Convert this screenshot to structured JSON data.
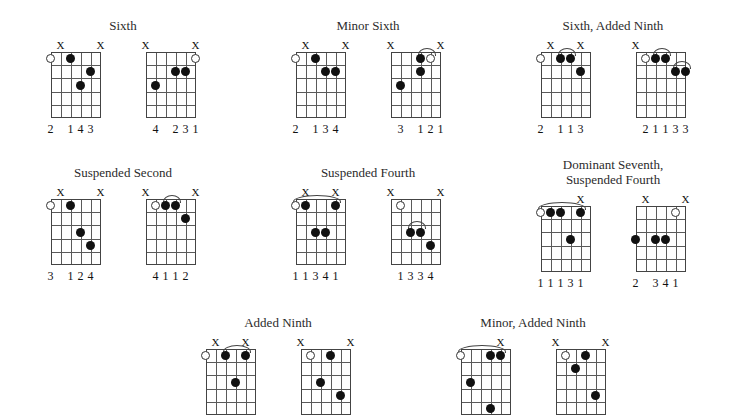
{
  "page": {
    "background": "#ffffff",
    "line_color": "#5a5a5a",
    "dot_color": "#111111",
    "text_color": "#1a1a1a",
    "strings": 6,
    "frets": 5
  },
  "groups": [
    {
      "title": "Sixth",
      "left": 8,
      "top": 18,
      "width": 230,
      "diagrams": [
        {
          "name": "sixth-voicing-1",
          "muted": [
            1,
            5
          ],
          "open": [
            0
          ],
          "dots": [
            {
              "string": 2,
              "fret": 1
            },
            {
              "string": 4,
              "fret": 2
            },
            {
              "string": 3,
              "fret": 3
            }
          ],
          "barres": [],
          "fingers": [
            {
              "string": 0,
              "label": "2"
            },
            {
              "string": 2,
              "label": "1"
            },
            {
              "string": 3,
              "label": "4"
            },
            {
              "string": 4,
              "label": "3"
            }
          ]
        },
        {
          "name": "sixth-voicing-2",
          "muted": [
            0,
            5
          ],
          "open": [
            5
          ],
          "dots": [
            {
              "string": 3,
              "fret": 2
            },
            {
              "string": 4,
              "fret": 2
            },
            {
              "string": 1,
              "fret": 3
            }
          ],
          "barres": [],
          "fingers": [
            {
              "string": 1,
              "label": "4"
            },
            {
              "string": 3,
              "label": "2"
            },
            {
              "string": 4,
              "label": "3"
            },
            {
              "string": 5,
              "label": "1"
            }
          ]
        }
      ]
    },
    {
      "title": "Minor Sixth",
      "left": 253,
      "top": 18,
      "width": 230,
      "diagrams": [
        {
          "name": "minor-sixth-voicing-1",
          "muted": [
            1,
            5
          ],
          "open": [
            0
          ],
          "dots": [
            {
              "string": 2,
              "fret": 1
            },
            {
              "string": 3,
              "fret": 2
            },
            {
              "string": 4,
              "fret": 2
            }
          ],
          "barres": [],
          "fingers": [
            {
              "string": 0,
              "label": "2"
            },
            {
              "string": 2,
              "label": "1"
            },
            {
              "string": 3,
              "label": "3"
            },
            {
              "string": 4,
              "label": "4"
            }
          ]
        },
        {
          "name": "minor-sixth-voicing-2",
          "muted": [
            0,
            5
          ],
          "open": [
            4
          ],
          "dots": [
            {
              "string": 3,
              "fret": 1
            },
            {
              "string": 3,
              "fret": 2
            },
            {
              "string": 1,
              "fret": 3
            }
          ],
          "barres": [
            {
              "from": 3,
              "to": 4,
              "fret": 1
            }
          ],
          "fingers": [
            {
              "string": 1,
              "label": "3"
            },
            {
              "string": 3,
              "label": "1"
            },
            {
              "string": 4,
              "label": "2"
            },
            {
              "string": 5,
              "label": "1"
            }
          ]
        }
      ]
    },
    {
      "title": "Sixth, Added Ninth",
      "left": 498,
      "top": 18,
      "width": 230,
      "diagrams": [
        {
          "name": "sixth-added-ninth-voicing-1",
          "muted": [
            1,
            4
          ],
          "open": [
            0
          ],
          "dots": [
            {
              "string": 2,
              "fret": 1
            },
            {
              "string": 3,
              "fret": 1
            },
            {
              "string": 4,
              "fret": 2
            }
          ],
          "barres": [
            {
              "from": 2,
              "to": 3,
              "fret": 1
            }
          ],
          "fingers": [
            {
              "string": 0,
              "label": "2"
            },
            {
              "string": 2,
              "label": "1"
            },
            {
              "string": 3,
              "label": "1"
            },
            {
              "string": 4,
              "label": "3"
            }
          ]
        },
        {
          "name": "sixth-added-ninth-voicing-2",
          "muted": [
            0
          ],
          "open": [
            1
          ],
          "dots": [
            {
              "string": 2,
              "fret": 1
            },
            {
              "string": 3,
              "fret": 1
            },
            {
              "string": 4,
              "fret": 2
            },
            {
              "string": 5,
              "fret": 2
            }
          ],
          "barres": [
            {
              "from": 2,
              "to": 3,
              "fret": 1
            },
            {
              "from": 4,
              "to": 5,
              "fret": 2
            }
          ],
          "fingers": [
            {
              "string": 1,
              "label": "2"
            },
            {
              "string": 2,
              "label": "1"
            },
            {
              "string": 3,
              "label": "1"
            },
            {
              "string": 4,
              "label": "3"
            },
            {
              "string": 5,
              "label": "3"
            }
          ]
        }
      ]
    },
    {
      "title": "Suspended Second",
      "left": 8,
      "top": 165,
      "width": 230,
      "diagrams": [
        {
          "name": "suspended-second-voicing-1",
          "muted": [
            1,
            5
          ],
          "open": [
            0
          ],
          "dots": [
            {
              "string": 2,
              "fret": 1
            },
            {
              "string": 3,
              "fret": 3
            },
            {
              "string": 4,
              "fret": 4
            }
          ],
          "barres": [],
          "fingers": [
            {
              "string": 0,
              "label": "3"
            },
            {
              "string": 2,
              "label": "1"
            },
            {
              "string": 3,
              "label": "2"
            },
            {
              "string": 4,
              "label": "4"
            }
          ]
        },
        {
          "name": "suspended-second-voicing-2",
          "muted": [
            0,
            5
          ],
          "open": [
            1
          ],
          "dots": [
            {
              "string": 2,
              "fret": 1
            },
            {
              "string": 3,
              "fret": 1
            },
            {
              "string": 4,
              "fret": 2
            }
          ],
          "barres": [
            {
              "from": 2,
              "to": 3,
              "fret": 1
            }
          ],
          "fingers": [
            {
              "string": 1,
              "label": "4"
            },
            {
              "string": 2,
              "label": "1"
            },
            {
              "string": 3,
              "label": "1"
            },
            {
              "string": 4,
              "label": "2"
            }
          ]
        }
      ]
    },
    {
      "title": "Suspended Fourth",
      "left": 253,
      "top": 165,
      "width": 230,
      "diagrams": [
        {
          "name": "suspended-fourth-voicing-1",
          "muted": [
            1,
            4
          ],
          "open": [
            0
          ],
          "dots": [
            {
              "string": 1,
              "fret": 1
            },
            {
              "string": 4,
              "fret": 1
            },
            {
              "string": 2,
              "fret": 3
            },
            {
              "string": 3,
              "fret": 3
            }
          ],
          "barres": [
            {
              "from": 0,
              "to": 4,
              "fret": 1
            }
          ],
          "fingers": [
            {
              "string": 0,
              "label": "1"
            },
            {
              "string": 1,
              "label": "1"
            },
            {
              "string": 2,
              "label": "3"
            },
            {
              "string": 3,
              "label": "4"
            },
            {
              "string": 4,
              "label": "1"
            }
          ]
        },
        {
          "name": "suspended-fourth-voicing-2",
          "muted": [
            0,
            5
          ],
          "open": [
            1
          ],
          "dots": [
            {
              "string": 2,
              "fret": 3
            },
            {
              "string": 3,
              "fret": 3
            },
            {
              "string": 4,
              "fret": 4
            }
          ],
          "barres": [
            {
              "from": 2,
              "to": 3,
              "fret": 3
            }
          ],
          "fingers": [
            {
              "string": 1,
              "label": "1"
            },
            {
              "string": 2,
              "label": "3"
            },
            {
              "string": 3,
              "label": "3"
            },
            {
              "string": 4,
              "label": "4"
            }
          ]
        }
      ]
    },
    {
      "title": "Dominant Seventh,\nSuspended Fourth",
      "title_line_1": "Dominant Seventh,",
      "title_line_2": "Suspended Fourth",
      "left": 498,
      "top": 157,
      "width": 230,
      "diagrams": [
        {
          "name": "dominant-seventh-suspended-fourth-voicing-1",
          "muted": [
            4
          ],
          "open": [
            0
          ],
          "dots": [
            {
              "string": 1,
              "fret": 1
            },
            {
              "string": 2,
              "fret": 1
            },
            {
              "string": 4,
              "fret": 1
            },
            {
              "string": 3,
              "fret": 3
            }
          ],
          "barres": [
            {
              "from": 0,
              "to": 4,
              "fret": 1
            }
          ],
          "fingers": [
            {
              "string": 0,
              "label": "1"
            },
            {
              "string": 1,
              "label": "1"
            },
            {
              "string": 2,
              "label": "1"
            },
            {
              "string": 3,
              "label": "3"
            },
            {
              "string": 4,
              "label": "1"
            }
          ]
        },
        {
          "name": "dominant-seventh-suspended-fourth-voicing-2",
          "muted": [
            1,
            5
          ],
          "open": [
            4
          ],
          "dots": [
            {
              "string": 0,
              "fret": 3
            },
            {
              "string": 2,
              "fret": 3
            },
            {
              "string": 3,
              "fret": 3
            }
          ],
          "barres": [],
          "fingers": [
            {
              "string": 0,
              "label": "2"
            },
            {
              "string": 2,
              "label": "3"
            },
            {
              "string": 3,
              "label": "4"
            },
            {
              "string": 4,
              "label": "1"
            }
          ]
        }
      ]
    },
    {
      "title": "Added Ninth",
      "left": 163,
      "top": 315,
      "width": 230,
      "diagrams": [
        {
          "name": "added-ninth-voicing-1",
          "muted": [
            1,
            4
          ],
          "open": [
            0
          ],
          "dots": [
            {
              "string": 2,
              "fret": 1
            },
            {
              "string": 4,
              "fret": 1
            },
            {
              "string": 3,
              "fret": 3
            }
          ],
          "barres": [
            {
              "from": 2,
              "to": 4,
              "fret": 1
            }
          ],
          "fingers": []
        },
        {
          "name": "added-ninth-voicing-2",
          "muted": [
            0,
            5
          ],
          "open": [
            1
          ],
          "dots": [
            {
              "string": 3,
              "fret": 1
            },
            {
              "string": 2,
              "fret": 3
            },
            {
              "string": 4,
              "fret": 4
            }
          ],
          "barres": [],
          "fingers": []
        }
      ]
    },
    {
      "title": "Minor, Added Ninth",
      "left": 418,
      "top": 315,
      "width": 230,
      "diagrams": [
        {
          "name": "minor-added-ninth-voicing-1",
          "muted": [
            4
          ],
          "open": [
            0
          ],
          "dots": [
            {
              "string": 3,
              "fret": 1
            },
            {
              "string": 4,
              "fret": 1
            },
            {
              "string": 1,
              "fret": 3
            },
            {
              "string": 3,
              "fret": 5
            }
          ],
          "barres": [
            {
              "from": 0,
              "to": 4,
              "fret": 1
            }
          ],
          "fingers": []
        },
        {
          "name": "minor-added-ninth-voicing-2",
          "muted": [
            0,
            5
          ],
          "open": [
            1
          ],
          "dots": [
            {
              "string": 3,
              "fret": 1
            },
            {
              "string": 2,
              "fret": 2
            },
            {
              "string": 4,
              "fret": 4
            }
          ],
          "barres": [],
          "fingers": []
        }
      ]
    }
  ]
}
